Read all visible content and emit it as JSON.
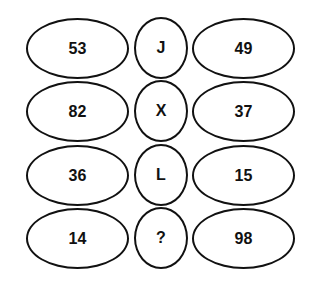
{
  "puzzle": {
    "rows": [
      {
        "left": "53",
        "middle": "J",
        "right": "49"
      },
      {
        "left": "82",
        "middle": "X",
        "right": "37"
      },
      {
        "left": "36",
        "middle": "L",
        "right": "15"
      },
      {
        "left": "14",
        "middle": "?",
        "right": "98"
      }
    ],
    "colors": {
      "stroke": "#111111",
      "background": "#ffffff",
      "text": "#111111"
    }
  }
}
